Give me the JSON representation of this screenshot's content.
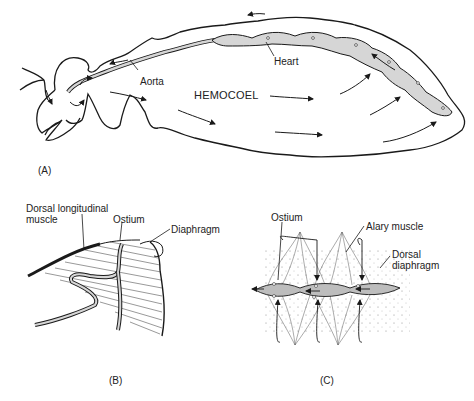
{
  "figure": {
    "panels": [
      {
        "id": "A",
        "panel_label": "(A)",
        "labels": {
          "aorta": "Aorta",
          "heart": "Heart",
          "hemocoel": "HEMOCOEL"
        }
      },
      {
        "id": "B",
        "panel_label": "(B)",
        "labels": {
          "dorsal_longitudinal_muscle_line1": "Dorsal longitudinal",
          "dorsal_longitudinal_muscle_line2": "muscle",
          "ostium": "Ostium",
          "diaphragm": "Diaphragm"
        }
      },
      {
        "id": "C",
        "panel_label": "(C)",
        "labels": {
          "ostium": "Ostium",
          "alary_muscle": "Alary muscle",
          "dorsal_diaphragm_line1": "Dorsal",
          "dorsal_diaphragm_line2": "diaphragm"
        }
      }
    ],
    "colors": {
      "line": "#1a1a1a",
      "vessel_fill": "#d6d6d6",
      "background": "#ffffff"
    }
  }
}
